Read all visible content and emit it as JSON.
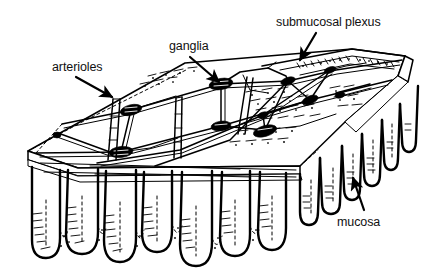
{
  "figure": {
    "kind": "anatomical line drawing",
    "style": "black ink line art on white background",
    "background_color": "#ffffff",
    "ink_color": "#000000",
    "text_color": "#111111",
    "width": 427,
    "height": 279
  },
  "labels": {
    "submucosal_plexus": "submucosal plexus",
    "ganglia": "ganglia",
    "arterioles": "arterioles",
    "mucosa": "mucosa"
  },
  "annotations": [
    {
      "id": "submucosal-plexus",
      "text": "submucosal plexus",
      "text_x": 276,
      "text_y": 16,
      "arrow_from": [
        316,
        33
      ],
      "arrow_to": [
        299,
        62
      ],
      "arrow_direction": "down-left"
    },
    {
      "id": "ganglia",
      "text": "ganglia",
      "text_x": 169,
      "text_y": 40,
      "arrow_from": [
        190,
        57
      ],
      "arrow_to": [
        221,
        84
      ],
      "arrow_direction": "down-right"
    },
    {
      "id": "arterioles",
      "text": "arterioles",
      "text_x": 52,
      "text_y": 61,
      "arrow_from": [
        76,
        77
      ],
      "arrow_to": [
        114,
        99
      ],
      "arrow_direction": "down-right"
    },
    {
      "id": "mucosa",
      "text": "mucosa",
      "text_x": 337,
      "text_y": 216,
      "arrow_from": [
        364,
        210
      ],
      "arrow_to": [
        352,
        176
      ],
      "arrow_direction": "up-left"
    }
  ],
  "structures": {
    "slab": {
      "name": "submucosa slab",
      "description": "flat wedge-shaped block drawn in oblique perspective, cut away at the front"
    },
    "plexus": {
      "name": "submucosal nerve plexus",
      "description": "polygonal mesh of nerve fibre bundles lying on the upper face of the submucosa slab"
    },
    "ganglia": {
      "name": "ganglia",
      "description": "solid black thickened nodes at the junctions of the plexus mesh",
      "count": 9,
      "nodes": [
        [
          131,
          110
        ],
        [
          221,
          84
        ],
        [
          288,
          81
        ],
        [
          221,
          126
        ],
        [
          263,
          115
        ],
        [
          310,
          100
        ],
        [
          121,
          152
        ],
        [
          330,
          70
        ],
        [
          265,
          130
        ]
      ]
    },
    "arterioles": {
      "name": "arterioles",
      "description": "paired parallel-line vessels that dive down through the submucosa toward the mucosa",
      "count": 4
    },
    "villi": {
      "name": "mucosal villi",
      "description": "finger-like mucosal projections hanging beneath the submucosa, with hatched and stippled shading",
      "front_row_count": 7,
      "side_row_count": 6
    }
  }
}
